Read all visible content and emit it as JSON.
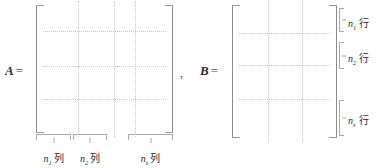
{
  "figure": {
    "type": "block-matrix-partition-diagram",
    "background_color": "#ffffff",
    "ink_color": "#3a3a3a",
    "dotted_line_color": "#c6c6c6",
    "bracket_color": "#8c8c8c",
    "separator": ","
  },
  "matrix_a": {
    "name": "A",
    "equals": "=",
    "label": "A =",
    "column_blocks": [
      {
        "symbol": "n",
        "subscript": "1",
        "unit": "列",
        "label": "n₁列"
      },
      {
        "symbol": "n",
        "subscript": "2",
        "unit": "列",
        "label": "n₂列"
      },
      {
        "symbol": "n",
        "subscript": "s",
        "unit": "列",
        "label": "n s列"
      }
    ],
    "vertical_partitions": 3,
    "horizontal_partitions": 3
  },
  "matrix_b": {
    "name": "B",
    "equals": "=",
    "label": "B =",
    "row_blocks": [
      {
        "symbol": "n",
        "subscript": "1",
        "unit": "行",
        "label": "n₁ 行"
      },
      {
        "symbol": "n",
        "subscript": "2",
        "unit": "行",
        "label": "n₂ 行"
      },
      {
        "symbol": "n",
        "subscript": "s",
        "unit": "行",
        "label": "n s 行"
      }
    ],
    "vertical_partitions": 2,
    "horizontal_partitions": 3
  }
}
